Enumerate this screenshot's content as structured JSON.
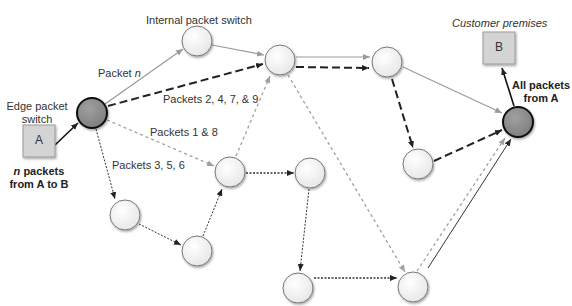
{
  "labels": {
    "internal_switch": "Internal packet switch",
    "customer_premises": "Customer premises",
    "edge_switch_line1": "Edge packet",
    "edge_switch_line2": "switch",
    "packet_n_prefix": "Packet ",
    "packet_n_var": "n",
    "packets_2479": "Packets 2, 4, 7, & 9",
    "packets_18": "Packets 1 & 8",
    "packets_356": "Packets 3, 5, 6",
    "n_packets_var": "n",
    "n_packets_line1_rest": " packets",
    "n_packets_line2": "from A to B",
    "all_packets_line1": "All packets",
    "all_packets_line2": "from A"
  },
  "hosts": {
    "source": "A",
    "destination": "B"
  },
  "colors": {
    "edge_node_fill": "#8f8f8f",
    "internal_node_fill": "#f3f3f3",
    "host_fill": "#d4d4d4",
    "solid_path": "#9a9a9a",
    "dashed_path": "#222222",
    "dotted_gray_path": "#a0a0a0",
    "dotted_dark_path": "#333333"
  }
}
